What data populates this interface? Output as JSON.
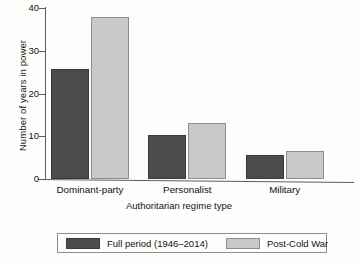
{
  "chart_data": {
    "type": "bar",
    "title": "",
    "xlabel": "Authoritarian regime type",
    "ylabel": "Number of years in power",
    "categories": [
      "Dominant-party",
      "Personalist",
      "Military"
    ],
    "series": [
      {
        "name": "Full period (1946–2014)",
        "color": "#4b4b4b",
        "values": [
          25.8,
          10.4,
          5.7
        ]
      },
      {
        "name": "Post-Cold War",
        "color": "#c9c9c9",
        "values": [
          37.8,
          13.0,
          6.6
        ]
      }
    ],
    "ylim": [
      0,
      40
    ],
    "yticks": [
      0,
      10,
      20,
      30,
      40
    ],
    "ytick_labels": [
      "0",
      "10",
      "20",
      "30",
      "40"
    ],
    "grid": false,
    "legend_position": "bottom"
  }
}
